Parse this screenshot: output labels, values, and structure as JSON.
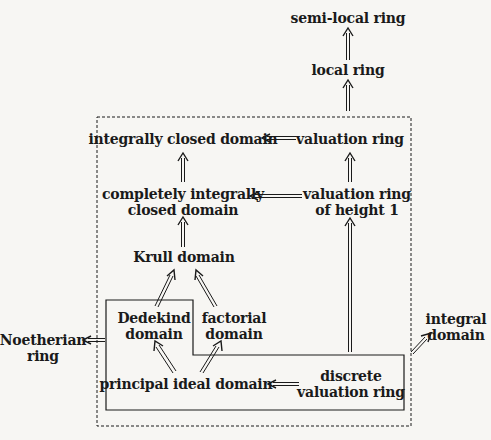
{
  "diagram": {
    "nodes": {
      "semi_local_ring": {
        "lines": [
          "semi-local ring"
        ]
      },
      "local_ring": {
        "lines": [
          "local ring"
        ]
      },
      "integrally_closed_domain": {
        "lines": [
          "integrally closed domain"
        ]
      },
      "valuation_ring": {
        "lines": [
          "valuation ring"
        ]
      },
      "completely_integrally_closed_domain": {
        "lines": [
          "completely integrally",
          "closed domain"
        ]
      },
      "valuation_ring_height_1": {
        "lines": [
          "valuation ring",
          "of height 1"
        ]
      },
      "krull_domain": {
        "lines": [
          "Krull domain"
        ]
      },
      "dedekind_domain": {
        "lines": [
          "Dedekind",
          "domain"
        ]
      },
      "factorial_domain": {
        "lines": [
          "factorial",
          "domain"
        ]
      },
      "noetherian_ring": {
        "lines": [
          "Noetherian",
          "ring"
        ]
      },
      "integral_domain": {
        "lines": [
          "integral",
          "domain"
        ]
      },
      "principal_ideal_domain": {
        "lines": [
          "principal ideal domain"
        ]
      },
      "discrete_valuation_ring": {
        "lines": [
          "discrete",
          "valuation ring"
        ]
      }
    },
    "edges": [
      {
        "from": "local ring",
        "to": "semi-local ring",
        "style": "double-arrow"
      },
      {
        "from": "valuation ring",
        "to": "local ring",
        "style": "double-arrow"
      },
      {
        "from": "valuation ring",
        "to": "integrally closed domain",
        "style": "double-arrow"
      },
      {
        "from": "completely integrally closed domain",
        "to": "integrally closed domain",
        "style": "double-arrow"
      },
      {
        "from": "valuation ring of height 1",
        "to": "valuation ring",
        "style": "double-arrow"
      },
      {
        "from": "valuation ring of height 1",
        "to": "completely integrally closed domain",
        "style": "double-arrow"
      },
      {
        "from": "Krull domain",
        "to": "completely integrally closed domain",
        "style": "double-arrow"
      },
      {
        "from": "Dedekind domain",
        "to": "Krull domain",
        "style": "double-arrow"
      },
      {
        "from": "factorial domain",
        "to": "Krull domain",
        "style": "double-arrow"
      },
      {
        "from": "principal ideal domain",
        "to": "Dedekind domain",
        "style": "double-arrow"
      },
      {
        "from": "principal ideal domain",
        "to": "factorial domain",
        "style": "double-arrow"
      },
      {
        "from": "discrete valuation ring",
        "to": "principal ideal domain",
        "style": "double-arrow"
      },
      {
        "from": "discrete valuation ring",
        "to": "valuation ring of height 1",
        "style": "double-arrow"
      },
      {
        "from": "solid region (Dedekind, PID, DVR)",
        "to": "Noetherian ring",
        "style": "double-arrow"
      },
      {
        "from": "dashed region (all domains inside)",
        "to": "integral domain",
        "style": "double-arrow"
      }
    ],
    "regions": [
      {
        "name": "dashed-region",
        "style": "dashed",
        "contains": [
          "integrally closed domain",
          "valuation ring",
          "completely integrally closed domain",
          "valuation ring of height 1",
          "Krull domain",
          "Dedekind domain",
          "factorial domain",
          "principal ideal domain",
          "discrete valuation ring"
        ]
      },
      {
        "name": "solid-region",
        "style": "solid",
        "contains": [
          "Dedekind domain",
          "principal ideal domain",
          "discrete valuation ring"
        ]
      }
    ]
  }
}
